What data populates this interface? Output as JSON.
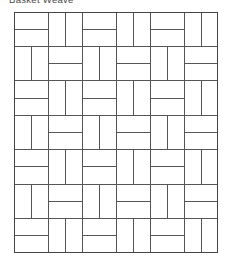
{
  "figure": {
    "caption": "Basket Weave",
    "pattern_name": "basket-weave",
    "background_color": "#ffffff",
    "line_color": "#555555",
    "outer_line_color": "#444444",
    "line_width": 1,
    "outer_line_width": 1.4
  },
  "grid": {
    "columns": 6,
    "rows": 7,
    "cell_width": 34,
    "cell_height": 34.43,
    "origin_x": 14,
    "origin_y": 12,
    "panel_width": 204,
    "panel_height": 241,
    "start_orientation": "horizontal",
    "alternation": "checkerboard",
    "bricks_per_cell": 2,
    "orientations": [
      [
        "horizontal",
        "vertical",
        "horizontal",
        "vertical",
        "horizontal",
        "vertical"
      ],
      [
        "vertical",
        "horizontal",
        "vertical",
        "horizontal",
        "vertical",
        "horizontal"
      ],
      [
        "horizontal",
        "vertical",
        "horizontal",
        "vertical",
        "horizontal",
        "vertical"
      ],
      [
        "vertical",
        "horizontal",
        "vertical",
        "horizontal",
        "vertical",
        "horizontal"
      ],
      [
        "horizontal",
        "vertical",
        "horizontal",
        "vertical",
        "horizontal",
        "vertical"
      ],
      [
        "vertical",
        "horizontal",
        "vertical",
        "horizontal",
        "vertical",
        "horizontal"
      ],
      [
        "horizontal",
        "vertical",
        "horizontal",
        "vertical",
        "horizontal",
        "vertical"
      ]
    ]
  }
}
